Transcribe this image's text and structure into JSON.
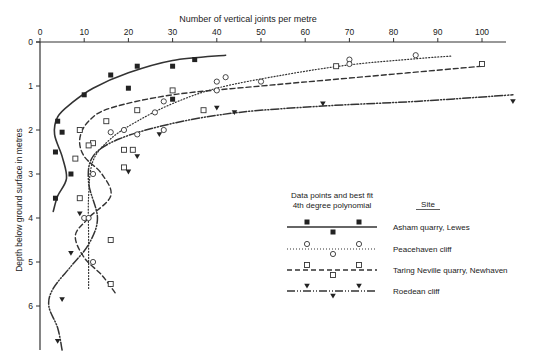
{
  "chart_data": {
    "type": "scatter",
    "title": "",
    "xlabel": "Number of vertical joints per metre",
    "ylabel": "Depth below ground surface in metres",
    "x_ticks": [
      0,
      10,
      20,
      30,
      40,
      50,
      60,
      70,
      80,
      90,
      100
    ],
    "y_ticks": [
      0,
      1,
      2,
      3,
      4,
      5,
      6
    ],
    "xlim": [
      0,
      107
    ],
    "ylim": [
      7,
      0
    ],
    "x_axis_position": "top",
    "y_inverted": true,
    "grid": false,
    "legend": {
      "position": "center-right",
      "header_left": "Data points and best fit",
      "header_left_line2": "4th degree polynomial",
      "header_right": "Site"
    },
    "series": [
      {
        "name": "Asham quarry, Lewes",
        "marker": "filled-square",
        "line_style": "solid",
        "points": [
          [
            4,
            1.8
          ],
          [
            5,
            2.05
          ],
          [
            3.5,
            2.5
          ],
          [
            7,
            3.0
          ],
          [
            3.5,
            3.55
          ],
          [
            10,
            1.2
          ],
          [
            16,
            0.75
          ],
          [
            20,
            1.05
          ],
          [
            22,
            0.55
          ],
          [
            30,
            0.55
          ],
          [
            35,
            0.4
          ],
          [
            30,
            1.3
          ]
        ],
        "fit": [
          [
            3,
            3.85
          ],
          [
            4,
            3.5
          ],
          [
            6,
            3.1
          ],
          [
            5,
            2.6
          ],
          [
            3.3,
            2.1
          ],
          [
            4,
            1.7
          ],
          [
            7,
            1.4
          ],
          [
            12,
            1.05
          ],
          [
            20,
            0.7
          ],
          [
            30,
            0.42
          ],
          [
            42,
            0.3
          ]
        ]
      },
      {
        "name": "Peacehaven cliff",
        "marker": "open-circle",
        "line_style": "dotted",
        "points": [
          [
            26,
            1.6
          ],
          [
            28,
            1.35
          ],
          [
            40,
            0.9
          ],
          [
            40,
            1.1
          ],
          [
            42,
            0.8
          ],
          [
            50,
            0.9
          ],
          [
            70,
            0.4
          ],
          [
            70,
            0.5
          ],
          [
            85,
            0.3
          ],
          [
            19,
            2.0
          ],
          [
            28,
            2.0
          ],
          [
            22,
            2.1
          ],
          [
            16,
            2.05
          ],
          [
            12,
            3.0
          ],
          [
            10,
            4.0
          ],
          [
            11,
            4.0
          ],
          [
            12,
            5.0
          ]
        ],
        "fit": [
          [
            11,
            5.6
          ],
          [
            11,
            4.5
          ],
          [
            11,
            3.5
          ],
          [
            12,
            2.7
          ],
          [
            16,
            2.2
          ],
          [
            22,
            1.8
          ],
          [
            30,
            1.4
          ],
          [
            40,
            1.05
          ],
          [
            55,
            0.75
          ],
          [
            70,
            0.52
          ],
          [
            85,
            0.38
          ],
          [
            93,
            0.32
          ]
        ]
      },
      {
        "name": "Taring Neville quarry, Newhaven",
        "marker": "open-square",
        "line_style": "dashed",
        "points": [
          [
            22,
            1.55
          ],
          [
            30,
            1.1
          ],
          [
            37,
            1.55
          ],
          [
            15,
            1.8
          ],
          [
            9,
            2.0
          ],
          [
            12,
            2.3
          ],
          [
            11,
            2.35
          ],
          [
            8,
            2.65
          ],
          [
            19,
            2.45
          ],
          [
            21,
            2.45
          ],
          [
            19,
            2.85
          ],
          [
            9,
            3.55
          ],
          [
            16,
            4.5
          ],
          [
            16,
            5.5
          ],
          [
            67,
            0.55
          ],
          [
            100,
            0.5
          ]
        ],
        "fit": [
          [
            17,
            5.7
          ],
          [
            14,
            5.3
          ],
          [
            10,
            4.9
          ],
          [
            8,
            4.4
          ],
          [
            11,
            4.0
          ],
          [
            16,
            3.5
          ],
          [
            14,
            3.0
          ],
          [
            10,
            2.6
          ],
          [
            9,
            2.2
          ],
          [
            11,
            1.8
          ],
          [
            16,
            1.5
          ],
          [
            30,
            1.2
          ],
          [
            50,
            1.0
          ],
          [
            70,
            0.82
          ],
          [
            100,
            0.55
          ]
        ]
      },
      {
        "name": "Roedean cliff",
        "marker": "filled-triangle-down",
        "line_style": "dash-dot-dot",
        "points": [
          [
            22,
            2.6
          ],
          [
            27,
            2.1
          ],
          [
            20,
            2.95
          ],
          [
            40,
            1.5
          ],
          [
            44,
            1.6
          ],
          [
            64,
            1.4
          ],
          [
            107,
            1.35
          ],
          [
            9,
            3.9
          ],
          [
            7,
            4.8
          ],
          [
            5,
            5.85
          ],
          [
            4,
            6.8
          ]
        ],
        "fit": [
          [
            5,
            7.0
          ],
          [
            4,
            6.5
          ],
          [
            2,
            6.0
          ],
          [
            3,
            5.6
          ],
          [
            7,
            5.1
          ],
          [
            11,
            4.6
          ],
          [
            13,
            4.0
          ],
          [
            11,
            3.2
          ],
          [
            12,
            2.6
          ],
          [
            18,
            2.2
          ],
          [
            30,
            1.85
          ],
          [
            45,
            1.6
          ],
          [
            65,
            1.45
          ],
          [
            85,
            1.35
          ],
          [
            107,
            1.2
          ]
        ]
      }
    ]
  }
}
